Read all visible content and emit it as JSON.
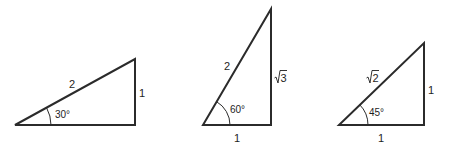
{
  "diagram": {
    "triangles": [
      {
        "id": "triangle-30",
        "angle_label": "30°",
        "hypotenuse_label": "2",
        "opposite_label": "1",
        "adjacent_label": ""
      },
      {
        "id": "triangle-60",
        "angle_label": "60°",
        "hypotenuse_label": "2",
        "opposite_label": "3",
        "opposite_radical": true,
        "adjacent_label": "1"
      },
      {
        "id": "triangle-45",
        "angle_label": "45°",
        "hypotenuse_label": "2",
        "hypotenuse_radical": true,
        "opposite_label": "1",
        "adjacent_label": "1"
      }
    ],
    "colors": {
      "stroke": "#2b2b2b",
      "text": "#1e1e1e",
      "background": "#ffffff"
    }
  }
}
